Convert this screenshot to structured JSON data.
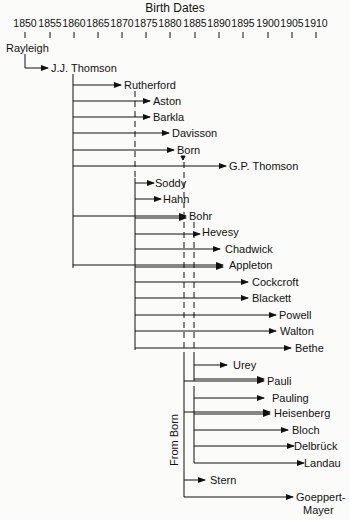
{
  "title": "Birth Dates",
  "axis": {
    "years": [
      "1850",
      "1855",
      "1860",
      "1865",
      "1870",
      "1875",
      "1880",
      "1885",
      "1890",
      "1895",
      "1900",
      "1905",
      "1910"
    ],
    "x0": 25,
    "px_per_year": 4.86
  },
  "side_label": "From Born",
  "root": {
    "name": "Rayleigh",
    "x": 6,
    "y": 48
  },
  "people": [
    {
      "name": "J.J. Thomson",
      "year": 1856,
      "y": 68
    },
    {
      "name": "Rutherford",
      "year": 1871,
      "y": 85
    },
    {
      "name": "Aston",
      "year": 1877,
      "y": 101
    },
    {
      "name": "Barkla",
      "year": 1877,
      "y": 117
    },
    {
      "name": "Davisson",
      "year": 1881,
      "y": 133
    },
    {
      "name": "Born",
      "year": 1882,
      "y": 150
    },
    {
      "name": "G.P. Thomson",
      "year": 1892,
      "y": 166
    },
    {
      "name": "Soddy",
      "year": 1877,
      "y": 183
    },
    {
      "name": "Hahn",
      "year": 1879,
      "y": 199
    },
    {
      "name": "Bohr",
      "year": 1885,
      "y": 216
    },
    {
      "name": "Hevesy",
      "year": 1885,
      "y": 232
    },
    {
      "name": "Chadwick",
      "year": 1891,
      "y": 249
    },
    {
      "name": "Appleton",
      "year": 1892,
      "y": 265
    },
    {
      "name": "Cockcroft",
      "year": 1897,
      "y": 282
    },
    {
      "name": "Blackett",
      "year": 1897,
      "y": 298
    },
    {
      "name": "Powell",
      "year": 1903,
      "y": 315
    },
    {
      "name": "Walton",
      "year": 1903,
      "y": 331
    },
    {
      "name": "Bethe",
      "year": 1906,
      "y": 348
    },
    {
      "name": "Urey",
      "year": 1893,
      "y": 365
    },
    {
      "name": "Pauli",
      "year": 1900,
      "y": 381
    },
    {
      "name": "Pauling",
      "year": 1901,
      "y": 398
    },
    {
      "name": "Heisenberg",
      "year": 1901,
      "y": 413
    },
    {
      "name": "Bloch",
      "year": 1905,
      "y": 430
    },
    {
      "name": "Delbrück",
      "year": 1906,
      "y": 446
    },
    {
      "name": "Landau",
      "year": 1908,
      "y": 463
    },
    {
      "name": "Stern",
      "year": 1888,
      "y": 480
    },
    {
      "name": "Goeppert-",
      "name2": "Mayer",
      "year": 1906,
      "y": 497
    }
  ]
}
